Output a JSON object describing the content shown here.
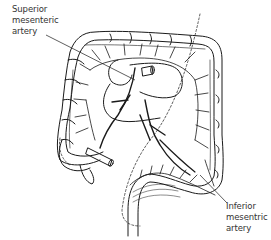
{
  "diagram": {
    "colors": {
      "background": "#ffffff",
      "line": "#1a1a1a",
      "label_text": "#333333"
    },
    "labels": [
      {
        "id": "superior",
        "lines": [
          "Superior",
          "mesenteric",
          "artery"
        ]
      },
      {
        "id": "inferior",
        "lines": [
          "Inferior",
          "mesentric",
          "artery"
        ]
      }
    ]
  }
}
